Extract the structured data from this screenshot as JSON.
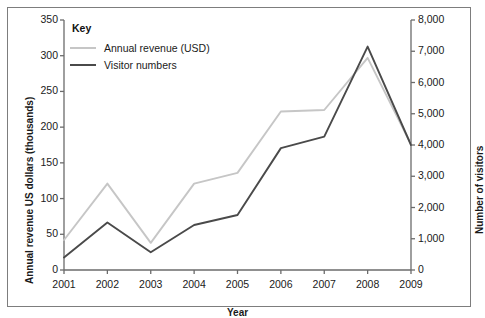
{
  "chart_data": {
    "type": "line",
    "title": "",
    "xlabel": "Year",
    "ylabel": "Annual revenue US dollars (thousands)",
    "ylabel_right": "Number of visitors",
    "x": [
      2001,
      2002,
      2003,
      2004,
      2005,
      2006,
      2007,
      2008,
      2009
    ],
    "xtick_labels": [
      "2001",
      "2002",
      "2003",
      "2004",
      "2005",
      "2006",
      "2007",
      "2008",
      "2009"
    ],
    "xlim": [
      2001,
      2009
    ],
    "ylim": [
      0,
      350
    ],
    "ytick_labels": [
      "0",
      "50",
      "100",
      "150",
      "200",
      "250",
      "300",
      "350"
    ],
    "ytick_values": [
      0,
      50,
      100,
      150,
      200,
      250,
      300,
      350
    ],
    "ylim_right": [
      0,
      8000
    ],
    "ytick_labels_right": [
      "0",
      "1,000",
      "2,000",
      "3,000",
      "4,000",
      "5,000",
      "6,000",
      "7,000",
      "8,000"
    ],
    "ytick_values_right": [
      0,
      1000,
      2000,
      3000,
      4000,
      5000,
      6000,
      7000,
      8000
    ],
    "grid": false,
    "legend_position": "top-left",
    "legend_title": "Key",
    "series": [
      {
        "name": "Annual revenue (USD)",
        "axis": "left",
        "color": "#c6c6c6",
        "values": [
          42,
          121,
          38,
          121,
          136,
          222,
          224,
          297,
          176
        ]
      },
      {
        "name": "Visitor numbers",
        "axis": "right",
        "color": "#4a4a4a",
        "values": [
          400,
          1520,
          570,
          1440,
          1760,
          3900,
          4270,
          7150,
          4000
        ]
      }
    ]
  },
  "legend": {
    "title": "Key",
    "entries": [
      {
        "label": "Annual revenue (USD)",
        "color": "#c6c6c6"
      },
      {
        "label": "Visitor numbers",
        "color": "#4a4a4a"
      }
    ]
  },
  "axes": {
    "x_title": "Year",
    "y_title_left": "Annual revenue US dollars (thousands)",
    "y_title_right": "Number of visitors"
  },
  "colors": {
    "frame": "#7d7d7d",
    "axis": "#6b6b6b",
    "text": "#1a1a1a",
    "background": "#ffffff",
    "revenue_line": "#c6c6c6",
    "visitor_line": "#4a4a4a"
  }
}
